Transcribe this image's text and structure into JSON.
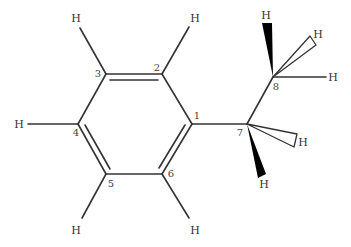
{
  "molecule": {
    "name": "ethylbenzene",
    "atoms": [
      {
        "id": "C1",
        "label": "1",
        "x": 192,
        "y": 124
      },
      {
        "id": "C2",
        "label": "2",
        "x": 162,
        "y": 74
      },
      {
        "id": "C3",
        "label": "3",
        "x": 106,
        "y": 74
      },
      {
        "id": "C4",
        "label": "4",
        "x": 78,
        "y": 124
      },
      {
        "id": "C5",
        "label": "5",
        "x": 106,
        "y": 174
      },
      {
        "id": "C6",
        "label": "6",
        "x": 162,
        "y": 174
      },
      {
        "id": "C7",
        "label": "7",
        "x": 247,
        "y": 124
      },
      {
        "id": "C8",
        "label": "8",
        "x": 273,
        "y": 77
      }
    ],
    "hydrogen_label": "H",
    "number_labels": {
      "n1": "1",
      "n2": "2",
      "n3": "3",
      "n4": "4",
      "n5": "5",
      "n6": "6",
      "n7": "7",
      "n8": "8"
    },
    "hydrogens": {
      "h2": "H",
      "h3": "H",
      "h4": "H",
      "h5": "H",
      "h6": "H",
      "h8a": "H",
      "h8b": "H",
      "h8c": "H",
      "h7a": "H",
      "h7b": "H"
    },
    "bonds": [
      {
        "from": "C1",
        "to": "C2",
        "order": 1
      },
      {
        "from": "C2",
        "to": "C3",
        "order": 2
      },
      {
        "from": "C3",
        "to": "C4",
        "order": 1
      },
      {
        "from": "C4",
        "to": "C5",
        "order": 2
      },
      {
        "from": "C5",
        "to": "C6",
        "order": 1
      },
      {
        "from": "C6",
        "to": "C1",
        "order": 2
      },
      {
        "from": "C1",
        "to": "C7",
        "order": 1
      },
      {
        "from": "C7",
        "to": "C8",
        "order": 1
      }
    ],
    "colors": {
      "bond": "#333333",
      "wedge": "#000000",
      "text": "#333333"
    }
  }
}
